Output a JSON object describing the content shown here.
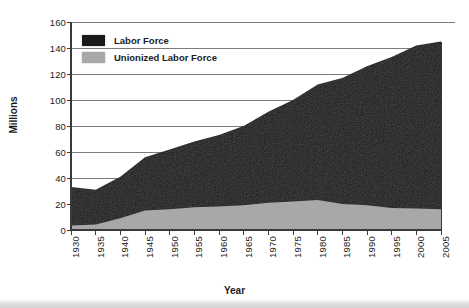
{
  "chart_data": {
    "type": "area",
    "title": "",
    "xlabel": "Year",
    "ylabel": "Millions",
    "xlim": [
      1930,
      2005
    ],
    "ylim": [
      0,
      160
    ],
    "ytick_step": 20,
    "xtick_step": 5,
    "grid": "horizontal",
    "stacked": false,
    "legend_position": "top-left",
    "yticks": [
      "0",
      "20",
      "40",
      "60",
      "80",
      "100",
      "120",
      "140",
      "160"
    ],
    "xticks": [
      "1930",
      "1935",
      "1940",
      "1945",
      "1950",
      "1955",
      "1960",
      "1965",
      "1970",
      "1975",
      "1980",
      "1985",
      "1990",
      "1995",
      "2000",
      "2005"
    ],
    "legend": [
      {
        "label": "Labor Force",
        "color": "#1a1a1a",
        "swatch": "black-swatch"
      },
      {
        "label": "Unionized Labor Force",
        "color": "#a8a8a8",
        "swatch": "gray-swatch"
      }
    ],
    "x": [
      1930,
      1935,
      1940,
      1945,
      1950,
      1955,
      1960,
      1965,
      1970,
      1975,
      1980,
      1985,
      1990,
      1995,
      2000,
      2005
    ],
    "series": [
      {
        "name": "Labor Force",
        "color": "#1a1a1a",
        "values": [
          33,
          31,
          41,
          56,
          62,
          68,
          73,
          80,
          91,
          100,
          112,
          117,
          126,
          133,
          142,
          145
        ]
      },
      {
        "name": "Unionized Labor Force",
        "color": "#a8a8a8",
        "values": [
          3.4,
          4.2,
          9,
          15,
          16,
          17.5,
          18,
          19,
          21,
          22,
          23,
          20,
          19,
          17,
          16.5,
          16
        ]
      }
    ],
    "colors": {
      "labor_force": "#1a1a1a",
      "unionized": "#a8a8a8",
      "axis": "#3a3a3a",
      "grid": "#6b6b6b",
      "text": "#1b1b1b",
      "background": "#ffffff"
    }
  },
  "axes": {
    "y_title": "Millions",
    "x_title": "Year"
  }
}
